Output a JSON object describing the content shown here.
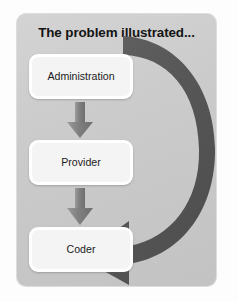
{
  "slide": {
    "title": "The problem illustrated...",
    "panel_color": "#c9c9c9",
    "background_color": "#fdfdfd"
  },
  "diagram": {
    "type": "flow-cycle",
    "node_fill": "#f4f4f4",
    "node_border": "#ffffff",
    "connector_color": "#8c8c8c",
    "loop_arrow_color": "#595959",
    "nodes": [
      {
        "id": "administration",
        "label": "Administration"
      },
      {
        "id": "provider",
        "label": "Provider"
      },
      {
        "id": "coder",
        "label": "Coder"
      }
    ],
    "connectors": [
      {
        "id": "admin-to-provider",
        "from": "administration",
        "to": "provider",
        "direction": "down"
      },
      {
        "id": "provider-to-coder",
        "from": "provider",
        "to": "coder",
        "direction": "down"
      }
    ],
    "loop_arrow": {
      "id": "coder-feedback-loop",
      "from": "administration",
      "to": "coder",
      "shape": "clockwise-curved-arrow",
      "head_direction": "left"
    }
  }
}
